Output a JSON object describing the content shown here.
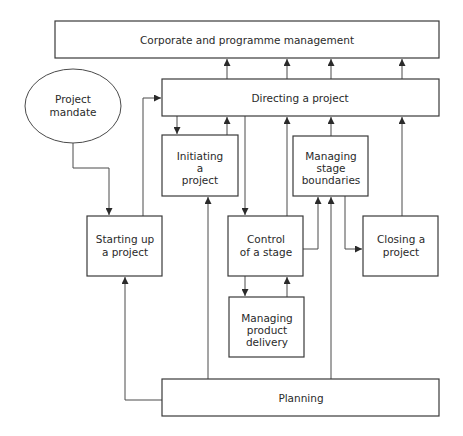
{
  "diagram": {
    "type": "process-flow",
    "nodes": {
      "corporate": {
        "shape": "rect",
        "lines": [
          "Corporate and programme management"
        ]
      },
      "mandate": {
        "shape": "ellipse",
        "lines": [
          "Project",
          "mandate"
        ]
      },
      "directing": {
        "shape": "rect",
        "lines": [
          "Directing a project"
        ]
      },
      "initiating": {
        "shape": "rect",
        "lines": [
          "Initiating",
          "a",
          "project"
        ]
      },
      "msb": {
        "shape": "rect",
        "lines": [
          "Managing",
          "stage",
          "boundaries"
        ]
      },
      "starting": {
        "shape": "rect",
        "lines": [
          "Starting up",
          "a project"
        ]
      },
      "control": {
        "shape": "rect",
        "lines": [
          "Control",
          "of a stage"
        ]
      },
      "closing": {
        "shape": "rect",
        "lines": [
          "Closing a",
          "project"
        ]
      },
      "mpd": {
        "shape": "rect",
        "lines": [
          "Managing",
          "product",
          "delivery"
        ]
      },
      "planning": {
        "shape": "rect",
        "lines": [
          "Planning"
        ]
      }
    },
    "edges": [
      {
        "from": "directing",
        "to": "corporate"
      },
      {
        "from": "directing",
        "to": "corporate"
      },
      {
        "from": "directing",
        "to": "corporate"
      },
      {
        "from": "directing",
        "to": "corporate"
      },
      {
        "from": "mandate",
        "to": "starting"
      },
      {
        "from": "starting",
        "to": "directing"
      },
      {
        "from": "directing",
        "to": "initiating"
      },
      {
        "from": "initiating",
        "to": "directing"
      },
      {
        "from": "directing",
        "to": "control"
      },
      {
        "from": "control",
        "to": "directing"
      },
      {
        "from": "msb",
        "to": "directing"
      },
      {
        "from": "closing",
        "to": "directing"
      },
      {
        "from": "control",
        "to": "msb"
      },
      {
        "from": "msb",
        "to": "closing"
      },
      {
        "from": "control",
        "to": "mpd"
      },
      {
        "from": "mpd",
        "to": "control"
      },
      {
        "from": "planning",
        "to": "starting"
      },
      {
        "from": "planning",
        "to": "initiating"
      },
      {
        "from": "planning",
        "to": "msb"
      }
    ],
    "colors": {
      "stroke": "#3a3a3a",
      "text": "#2a2a2a",
      "background": "#ffffff"
    }
  }
}
